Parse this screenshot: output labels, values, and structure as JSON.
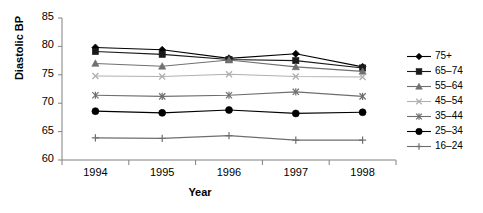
{
  "chart_data": {
    "type": "line",
    "title": "",
    "xlabel": "Year",
    "ylabel": "Diastolic BP",
    "x": [
      "1994",
      "1995",
      "1996",
      "1997",
      "1998"
    ],
    "xticklabels": [
      "1994",
      "1995",
      "1996",
      "1997",
      "1998"
    ],
    "yticklabels": [
      "60",
      "65",
      "70",
      "75",
      "80",
      "85"
    ],
    "yticks": [
      60,
      65,
      70,
      75,
      80,
      85
    ],
    "ylim": [
      60,
      85
    ],
    "grid": false,
    "legend_position": "right",
    "series": [
      {
        "name": "75+",
        "marker": "diamond",
        "color": "#000000",
        "values": [
          79.8,
          79.4,
          77.9,
          78.7,
          76.4
        ]
      },
      {
        "name": "65–74",
        "marker": "square",
        "color": "#1a1a1a",
        "values": [
          79.1,
          78.6,
          77.7,
          77.5,
          76.2
        ]
      },
      {
        "name": "55–64",
        "marker": "triangle",
        "color": "#707070",
        "values": [
          77.0,
          76.5,
          77.6,
          76.4,
          75.6
        ]
      },
      {
        "name": "45–54",
        "marker": "x",
        "color": "#b0b0b0",
        "values": [
          74.8,
          74.7,
          75.1,
          74.7,
          74.6
        ]
      },
      {
        "name": "35–44",
        "marker": "asterisk",
        "color": "#6e6e6e",
        "values": [
          71.4,
          71.2,
          71.4,
          72.0,
          71.2
        ]
      },
      {
        "name": "25–34",
        "marker": "circle",
        "color": "#000000",
        "values": [
          68.6,
          68.3,
          68.8,
          68.2,
          68.4
        ]
      },
      {
        "name": "16–24",
        "marker": "plus",
        "color": "#6e6e6e",
        "values": [
          63.9,
          63.8,
          64.3,
          63.5,
          63.5
        ]
      }
    ]
  },
  "axes": {
    "y_label": "Diastolic BP",
    "x_label": "Year"
  }
}
